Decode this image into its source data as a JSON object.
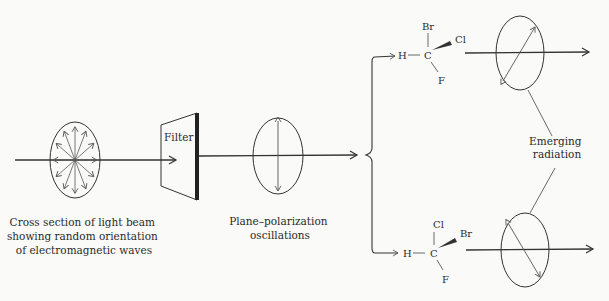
{
  "labels": {
    "filter": "Filter",
    "cross_section": [
      "Cross section of light beam",
      "showing random orientation",
      "of electromagnetic waves"
    ],
    "plane_polarization": [
      "Plane–polarization",
      "oscillations"
    ],
    "emerging": [
      "Emerging",
      "radiation"
    ]
  },
  "molecule_top": {
    "center": "C",
    "left": "H",
    "up": "Br",
    "wedge": "Cl",
    "down": "F"
  },
  "molecule_bottom": {
    "center": "C",
    "left": "H",
    "up": "Cl",
    "wedge": "Br",
    "down": "F"
  },
  "colors": {
    "ink": "#2a2a2a",
    "background": "#fafaf8"
  }
}
